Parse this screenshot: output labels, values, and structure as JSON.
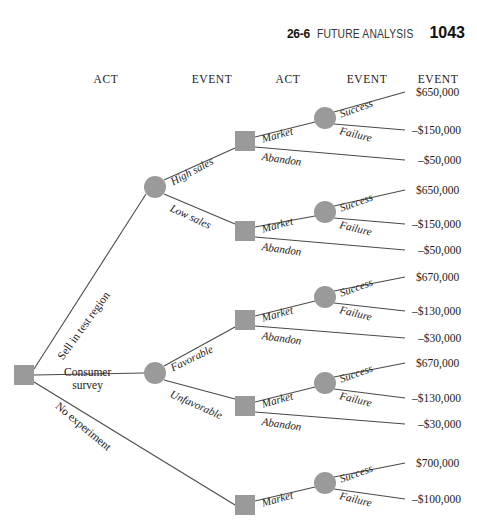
{
  "header": {
    "section": "26-6",
    "title": "FUTURE ANALYSIS",
    "page": "1043"
  },
  "column_headers": [
    {
      "label": "ACT",
      "x": 106,
      "y": 73
    },
    {
      "label": "EVENT",
      "x": 212,
      "y": 73
    },
    {
      "label": "ACT",
      "x": 288,
      "y": 73
    },
    {
      "label": "EVENT",
      "x": 367,
      "y": 73
    },
    {
      "label": "EVENT",
      "x": 438,
      "y": 73
    }
  ],
  "nodes": {
    "root_act": {
      "type": "square",
      "x": 24,
      "y": 375
    },
    "event_nodes": [
      {
        "name": "test-region-outcome",
        "x": 155,
        "y": 187
      },
      {
        "name": "survey-outcome",
        "x": 155,
        "y": 373
      },
      {
        "name": "success-failure-1",
        "x": 325,
        "y": 118
      },
      {
        "name": "success-failure-2",
        "x": 325,
        "y": 212
      },
      {
        "name": "success-failure-3",
        "x": 325,
        "y": 297
      },
      {
        "name": "success-failure-4",
        "x": 325,
        "y": 383
      },
      {
        "name": "success-failure-5",
        "x": 325,
        "y": 483
      }
    ],
    "act_nodes": [
      {
        "name": "act-high-sales",
        "x": 245,
        "y": 141
      },
      {
        "name": "act-low-sales",
        "x": 245,
        "y": 231
      },
      {
        "name": "act-favorable",
        "x": 245,
        "y": 320
      },
      {
        "name": "act-unfavorable",
        "x": 245,
        "y": 406
      },
      {
        "name": "act-no-experiment",
        "x": 245,
        "y": 505
      }
    ]
  },
  "root_branches": [
    {
      "label": "Sell in test region",
      "rotation": -54,
      "x": 60,
      "y": 352
    },
    {
      "label": "Consumer survey",
      "rotation": 0,
      "x": 64,
      "y": 366
    },
    {
      "label": "No experiment",
      "rotation": 40,
      "x": 57,
      "y": 398
    }
  ],
  "event_branches": [
    {
      "label": "High sales",
      "rotation": -28,
      "x": 171,
      "y": 176
    },
    {
      "label": "Low sales",
      "rotation": 25,
      "x": 171,
      "y": 201
    },
    {
      "label": "Favorable",
      "rotation": -26,
      "x": 171,
      "y": 362
    },
    {
      "label": "Unfavorable",
      "rotation": 24,
      "x": 171,
      "y": 387
    }
  ],
  "groups": [
    {
      "name": "group-high-sales",
      "market_label": "Market",
      "abandon_label": "Abandon",
      "success_label": "Success",
      "failure_label": "Failure",
      "market_rot": -16,
      "market_x": 262,
      "market_y": 133,
      "abandon_rot": 8,
      "abandon_x": 262,
      "abandon_y": 150,
      "success_rot": -20,
      "success_x": 340,
      "success_y": 108,
      "failure_rot": 14,
      "failure_x": 340,
      "failure_y": 124,
      "payoffs": [
        {
          "value": "$650,000",
          "x": 416,
          "y": 92
        },
        {
          "value": "–$150,000",
          "x": 412,
          "y": 130
        },
        {
          "value": "–$50,000",
          "x": 418,
          "y": 160
        }
      ]
    },
    {
      "name": "group-low-sales",
      "market_label": "Market",
      "abandon_label": "Abandon",
      "success_label": "Success",
      "failure_label": "Failure",
      "market_rot": -16,
      "market_x": 262,
      "market_y": 223,
      "abandon_rot": 8,
      "abandon_x": 262,
      "abandon_y": 240,
      "success_rot": -20,
      "success_x": 340,
      "success_y": 202,
      "failure_rot": 14,
      "failure_x": 340,
      "failure_y": 218,
      "payoffs": [
        {
          "value": "$650,000",
          "x": 416,
          "y": 190
        },
        {
          "value": "–$150,000",
          "x": 412,
          "y": 224
        },
        {
          "value": "–$50,000",
          "x": 418,
          "y": 250
        }
      ]
    },
    {
      "name": "group-favorable",
      "market_label": "Market",
      "abandon_label": "Abandon",
      "success_label": "Success",
      "failure_label": "Failure",
      "market_rot": -16,
      "market_x": 262,
      "market_y": 312,
      "abandon_rot": 8,
      "abandon_x": 262,
      "abandon_y": 329,
      "success_rot": -20,
      "success_x": 340,
      "success_y": 287,
      "failure_rot": 14,
      "failure_x": 340,
      "failure_y": 303,
      "payoffs": [
        {
          "value": "$670,000",
          "x": 416,
          "y": 277
        },
        {
          "value": "–$130,000",
          "x": 412,
          "y": 311
        },
        {
          "value": "–$30,000",
          "x": 418,
          "y": 338
        }
      ]
    },
    {
      "name": "group-unfavorable",
      "market_label": "Market",
      "abandon_label": "Abandon",
      "success_label": "Success",
      "failure_label": "Failure",
      "market_rot": -16,
      "market_x": 262,
      "market_y": 398,
      "abandon_rot": 8,
      "abandon_x": 262,
      "abandon_y": 415,
      "success_rot": -20,
      "success_x": 340,
      "success_y": 373,
      "failure_rot": 14,
      "failure_x": 340,
      "failure_y": 389,
      "payoffs": [
        {
          "value": "$670,000",
          "x": 416,
          "y": 363
        },
        {
          "value": "–$130,000",
          "x": 412,
          "y": 398
        },
        {
          "value": "–$30,000",
          "x": 418,
          "y": 424
        }
      ]
    },
    {
      "name": "group-no-experiment",
      "market_label": "Market",
      "abandon_label": "",
      "success_label": "Success",
      "failure_label": "Failure",
      "market_rot": -16,
      "market_x": 262,
      "market_y": 497,
      "abandon_rot": 0,
      "abandon_x": 0,
      "abandon_y": 0,
      "success_rot": -20,
      "success_x": 340,
      "success_y": 473,
      "failure_rot": 14,
      "failure_x": 340,
      "failure_y": 489,
      "payoffs": [
        {
          "value": "$700,000",
          "x": 416,
          "y": 463
        },
        {
          "value": "–$100,000",
          "x": 412,
          "y": 499
        }
      ]
    }
  ],
  "style": {
    "node_fill": "#9a9a9a",
    "line_color": "#4a4a4a",
    "background": "#ffffff"
  }
}
